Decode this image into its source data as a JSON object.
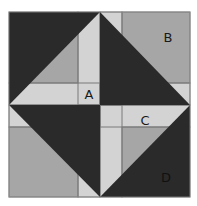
{
  "diagram": {
    "type": "quilt-block",
    "colors": {
      "dark": "#2a2a2a",
      "medium": "#a6a6a6",
      "light": "#d3d3d3",
      "line": "#7a7a7a",
      "background": "#ffffff"
    },
    "labels": {
      "a": "A",
      "b": "B",
      "c": "C",
      "d": "D"
    }
  }
}
